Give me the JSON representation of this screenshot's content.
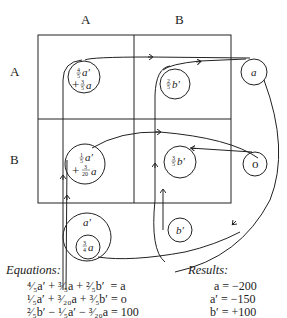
{
  "diagram": {
    "column_labels": [
      "A",
      "B"
    ],
    "row_labels": [
      "A",
      "B"
    ],
    "nodes": {
      "aa": {
        "line1": "a'",
        "coef1": "4/5",
        "line2": "+",
        "coef2": "3/5",
        "var2": "a"
      },
      "ab": {
        "coef": "2/5",
        "var": "b'"
      },
      "a_out": {
        "label": "a"
      },
      "ba": {
        "line1": "a'",
        "coef1": "1/5",
        "line2": "+",
        "coef2": "3/20",
        "var2": "a"
      },
      "bb": {
        "coef": "3/5",
        "var": "b'"
      },
      "zero": {
        "label": "o"
      },
      "a_prime": {
        "label": "a'"
      },
      "a_inner": {
        "coef": "3/4",
        "var": "a"
      },
      "b_prime": {
        "label": "b'"
      }
    }
  },
  "equations": {
    "title": "Equations:",
    "lines": [
      "⁴⁄₅a′ + ³⁄₅a + ²⁄₅b′  = a",
      "¹⁄₅a′ + ³⁄₂₀a + ³⁄₅b′ = o",
      "²⁄₅b′ − ¹⁄₅a′ − ³⁄₂₀a = 100"
    ]
  },
  "results": {
    "title": "Results:",
    "lines": [
      "a = −200",
      "a′ = −150",
      "b′ = +100"
    ]
  }
}
